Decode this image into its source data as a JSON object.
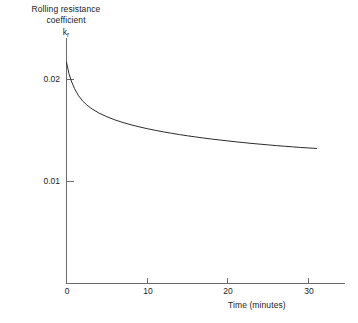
{
  "chart_data": {
    "type": "line",
    "title": "",
    "ylabel_lines": [
      "Rolling resistance",
      "coefficient"
    ],
    "ylabel_symbol": "k",
    "ylabel_symbol_sub": "r",
    "xlabel": "Time (minutes)",
    "xlim": [
      0,
      34.5
    ],
    "ylim": [
      0.0056,
      0.0232
    ],
    "xticks": [
      0,
      10,
      20,
      30
    ],
    "xtick_labels": [
      "0",
      "10",
      "20",
      "30"
    ],
    "yticks": [
      0.01,
      0.02
    ],
    "ytick_labels": [
      "0.01",
      "0.02"
    ],
    "grid": false,
    "legend": null,
    "line_color": "#2b2b2b",
    "axis_color": "#6b6b6b",
    "series": [
      {
        "name": "Rolling resistance coefficient",
        "x": [
          0,
          0.3,
          0.6,
          1.0,
          1.5,
          2.0,
          2.5,
          3.0,
          4.0,
          5.0,
          6.0,
          7.0,
          8.0,
          9.0,
          10.0,
          11.0,
          12.0,
          13.0,
          14.0,
          15.0,
          16.0,
          17.0,
          18.0,
          19.0,
          20.0,
          21.0,
          22.0,
          23.0,
          24.0,
          25.0,
          26.0,
          27.0,
          28.0,
          29.0,
          30.0,
          31.0
        ],
        "y": [
          0.0217,
          0.0206,
          0.01985,
          0.0191,
          0.0184,
          0.0179,
          0.01752,
          0.0172,
          0.01672,
          0.01635,
          0.01604,
          0.01578,
          0.01556,
          0.01536,
          0.01518,
          0.01502,
          0.01487,
          0.01473,
          0.0146,
          0.01448,
          0.01437,
          0.01426,
          0.01416,
          0.01407,
          0.01398,
          0.01389,
          0.01381,
          0.01373,
          0.01366,
          0.01359,
          0.01352,
          0.01346,
          0.0134,
          0.01334,
          0.01329,
          0.01324
        ]
      }
    ]
  },
  "axes": {
    "y_tick_0": "0.02",
    "y_tick_1": "0.01",
    "x_tick_0": "0",
    "x_tick_1": "10",
    "x_tick_2": "20",
    "x_tick_3": "30",
    "x_axis_title": "Time (minutes)",
    "y_axis_title_line1": "Rolling resistance",
    "y_axis_title_line2": "coefficient",
    "y_axis_title_symbol": "k",
    "y_axis_title_symbol_sub": "r"
  }
}
